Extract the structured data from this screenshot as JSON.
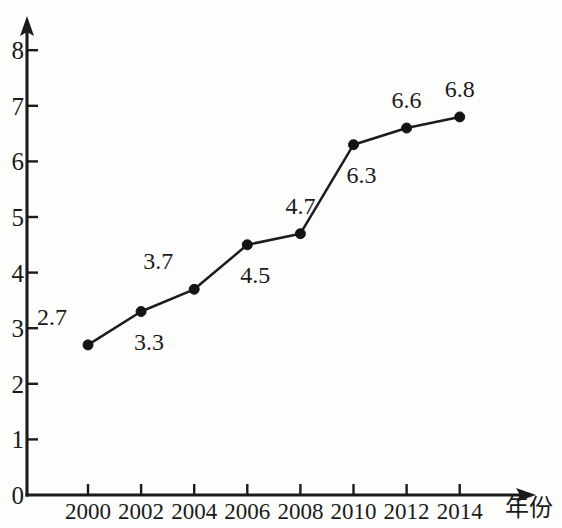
{
  "chart_data": {
    "type": "line",
    "title": "",
    "subtitle": "",
    "xlabel": "年份",
    "ylabel": "",
    "categories": [
      "2000",
      "2002",
      "2004",
      "2006",
      "2008",
      "2010",
      "2012",
      "2014"
    ],
    "x": [
      2000,
      2002,
      2004,
      2006,
      2008,
      2010,
      2012,
      2014
    ],
    "values": [
      2.7,
      3.3,
      3.7,
      4.5,
      4.7,
      6.3,
      6.6,
      6.8
    ],
    "point_labels": [
      "2.7",
      "3.3",
      "3.7",
      "4.5",
      "4.7",
      "6.3",
      "6.6",
      "6.8"
    ],
    "point_label_positions": [
      "above-left",
      "below",
      "above-left",
      "below",
      "above",
      "below",
      "above",
      "above"
    ],
    "series": [
      {
        "name": "",
        "values": [
          2.7,
          3.3,
          3.7,
          4.5,
          4.7,
          6.3,
          6.6,
          6.8
        ],
        "color": "#1c1c1c",
        "marker": "filled-circle"
      }
    ],
    "ylim": [
      0,
      8.6
    ],
    "xlim": [
      1999,
      2015.6
    ],
    "y_ticks": [
      0,
      1,
      2,
      3,
      4,
      5,
      6,
      7,
      8
    ],
    "y_tick_labels": [
      "0",
      "1",
      "2",
      "3",
      "4",
      "5",
      "6",
      "7",
      "8"
    ],
    "x_ticks": [
      2000,
      2002,
      2004,
      2006,
      2008,
      2010,
      2012,
      2014
    ],
    "x_tick_labels": [
      "2000",
      "2002",
      "2004",
      "2006",
      "2008",
      "2010",
      "2012",
      "2014"
    ],
    "grid": false,
    "legend": false,
    "legend_position": "none",
    "axis_style": "arrow-ended",
    "line_color": "#1c1c1c",
    "text_color": "#1a1a1a",
    "background_color": "#fdfdfc"
  }
}
